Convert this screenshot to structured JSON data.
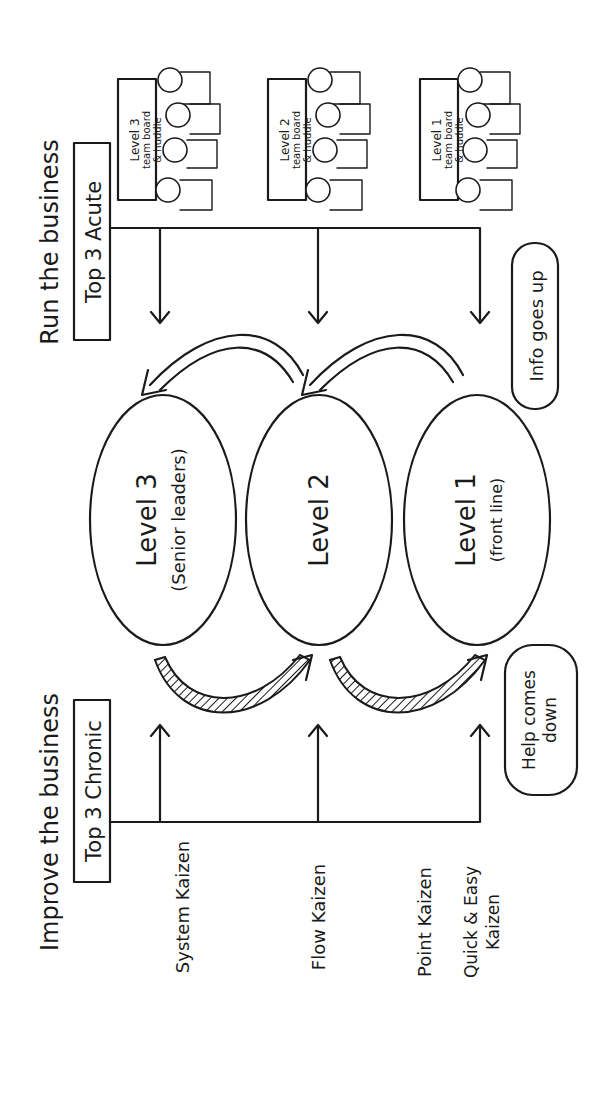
{
  "left_section": {
    "title": "Run the business",
    "box_label": "Top 3 Acute",
    "team_boards": [
      {
        "line1": "Level 3",
        "line2": "team board",
        "line3": "& huddle"
      },
      {
        "line1": "Level 2",
        "line2": "team board",
        "line3": "& huddle"
      },
      {
        "line1": "Level 1",
        "line2": "team board",
        "line3": "& huddle"
      }
    ]
  },
  "levels": [
    {
      "name": "Level 3",
      "sub": "(Senior leaders)"
    },
    {
      "name": "Level 2",
      "sub": ""
    },
    {
      "name": "Level 1",
      "sub": "(front line)"
    }
  ],
  "clouds": {
    "info": "Info goes up",
    "help_line1": "Help comes",
    "help_line2": "down"
  },
  "right_section": {
    "title": "Improve the business",
    "box_label": "Top 3 Chronic",
    "kaizen": [
      {
        "line1": "System Kaizen",
        "line2": ""
      },
      {
        "line1": "Flow Kaizen",
        "line2": ""
      },
      {
        "line1": "Point Kaizen",
        "line2": ""
      },
      {
        "line1": "Quick & Easy",
        "line2": "Kaizen"
      }
    ]
  },
  "colors": {
    "ink": "#1a1a1a",
    "background": "#ffffff"
  }
}
